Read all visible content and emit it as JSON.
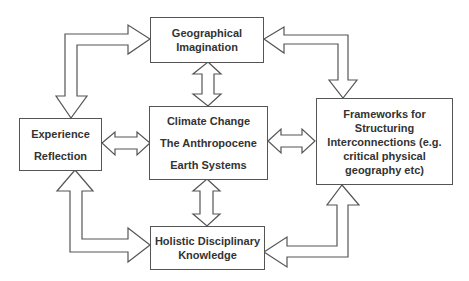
{
  "diagram": {
    "type": "concept-map",
    "colors": {
      "stroke": "#555555",
      "text": "#333333",
      "fill": "#ffffff"
    },
    "nodes": {
      "top": {
        "lines": [
          "Geographical",
          "Imagination"
        ]
      },
      "center": {
        "lines": [
          "Climate Change",
          "The Anthropocene",
          "Earth Systems"
        ]
      },
      "left": {
        "lines": [
          "Experience",
          "Reflection"
        ]
      },
      "right": {
        "lines": [
          "Frameworks for",
          "Structuring",
          "Interconnections (e.g.",
          "critical physical",
          "geography etc)"
        ]
      },
      "bottom": {
        "lines": [
          "Holistic Disciplinary",
          "Knowledge"
        ]
      }
    },
    "edges": [
      {
        "from": "top",
        "to": "center",
        "style": "double-headed block arrow"
      },
      {
        "from": "center",
        "to": "bottom",
        "style": "double-headed block arrow"
      },
      {
        "from": "left",
        "to": "center",
        "style": "double-headed block arrow"
      },
      {
        "from": "center",
        "to": "right",
        "style": "double-headed block arrow"
      },
      {
        "from": "top",
        "to": "left",
        "style": "elbow double-headed block arrow"
      },
      {
        "from": "top",
        "to": "right",
        "style": "elbow double-headed block arrow"
      },
      {
        "from": "left",
        "to": "bottom",
        "style": "elbow double-headed block arrow"
      },
      {
        "from": "bottom",
        "to": "right",
        "style": "elbow double-headed block arrow"
      }
    ]
  }
}
